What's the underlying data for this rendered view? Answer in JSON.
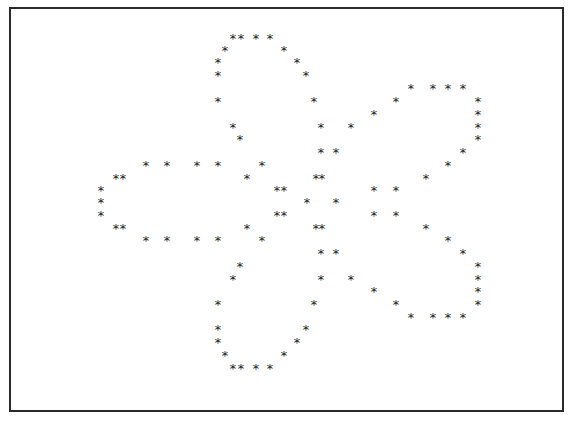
{
  "figure": {
    "glyph": "*",
    "color": "#222222",
    "border_color": "#2a2a2a",
    "parts": [
      {
        "name": "top-petal",
        "count": 22
      },
      {
        "name": "left-petal",
        "count": 18
      },
      {
        "name": "upper-right-petal",
        "count": 20
      },
      {
        "name": "lower-right-petal",
        "count": 20
      },
      {
        "name": "bottom-petal",
        "count": 22
      },
      {
        "name": "center",
        "count": 12
      }
    ]
  }
}
